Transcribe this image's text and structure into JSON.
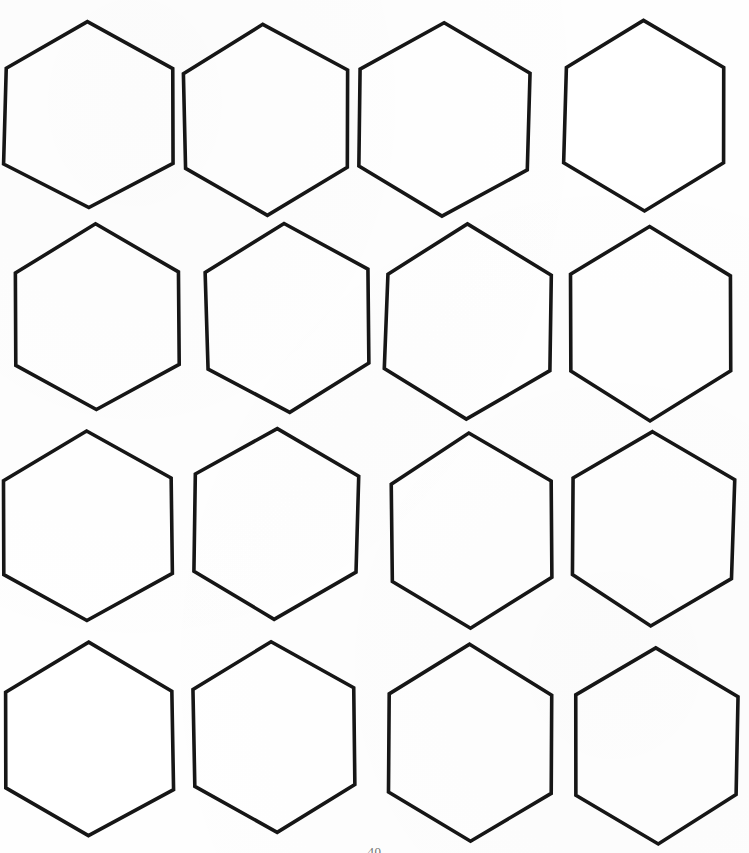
{
  "document": {
    "kind": "hexagon-template-worksheet",
    "title": "Hexagon Template Sheet",
    "page_number": "40",
    "background_color": "#fefefe",
    "stroke_color": "#161616",
    "stroke_width_px": 3.6,
    "canvas": {
      "width": 749,
      "height": 853
    }
  },
  "grid": {
    "rows": 4,
    "columns": 4,
    "total_shapes": 16,
    "shape_type": "hexagon",
    "orientation": "pointy-top",
    "fill": "none"
  },
  "shapes": [
    {
      "id": "hex-r1c1",
      "row": 1,
      "col": 1,
      "cx": 89,
      "cy": 116,
      "rx": 84,
      "ry": 93,
      "rot": 0.0
    },
    {
      "id": "hex-r1c2",
      "row": 1,
      "col": 2,
      "cx": 266,
      "cy": 120,
      "rx": 82,
      "ry": 96,
      "rot": -1.0
    },
    {
      "id": "hex-r1c3",
      "row": 1,
      "col": 3,
      "cx": 444,
      "cy": 120,
      "rx": 84,
      "ry": 96,
      "rot": 1.0
    },
    {
      "id": "hex-r1c4",
      "row": 1,
      "col": 4,
      "cx": 645,
      "cy": 115,
      "rx": 80,
      "ry": 95,
      "rot": 0.0
    },
    {
      "id": "hex-r2c1",
      "row": 2,
      "col": 1,
      "cx": 97,
      "cy": 318,
      "rx": 82,
      "ry": 93,
      "rot": 0.0
    },
    {
      "id": "hex-r2c2",
      "row": 2,
      "col": 2,
      "cx": 288,
      "cy": 318,
      "rx": 81,
      "ry": 95,
      "rot": -1.5
    },
    {
      "id": "hex-r2c3",
      "row": 2,
      "col": 3,
      "cx": 468,
      "cy": 322,
      "rx": 82,
      "ry": 97,
      "rot": 0.5
    },
    {
      "id": "hex-r2c4",
      "row": 2,
      "col": 4,
      "cx": 651,
      "cy": 323,
      "rx": 81,
      "ry": 97,
      "rot": 0.0
    },
    {
      "id": "hex-r3c1",
      "row": 3,
      "col": 1,
      "cx": 88,
      "cy": 527,
      "rx": 84,
      "ry": 95,
      "rot": 0.0
    },
    {
      "id": "hex-r3c2",
      "row": 3,
      "col": 2,
      "cx": 277,
      "cy": 524,
      "rx": 81,
      "ry": 96,
      "rot": 1.0
    },
    {
      "id": "hex-r3c3",
      "row": 3,
      "col": 3,
      "cx": 471,
      "cy": 531,
      "rx": 80,
      "ry": 97,
      "rot": -0.5
    },
    {
      "id": "hex-r3c4",
      "row": 3,
      "col": 4,
      "cx": 653,
      "cy": 528,
      "rx": 80,
      "ry": 97,
      "rot": 0.5
    },
    {
      "id": "hex-r4c1",
      "row": 4,
      "col": 1,
      "cx": 90,
      "cy": 740,
      "rx": 83,
      "ry": 97,
      "rot": 0.0
    },
    {
      "id": "hex-r4c2",
      "row": 4,
      "col": 2,
      "cx": 274,
      "cy": 737,
      "rx": 81,
      "ry": 96,
      "rot": -1.0
    },
    {
      "id": "hex-r4c3",
      "row": 4,
      "col": 3,
      "cx": 470,
      "cy": 743,
      "rx": 81,
      "ry": 98,
      "rot": 0.5
    },
    {
      "id": "hex-r4c4",
      "row": 4,
      "col": 4,
      "cx": 657,
      "cy": 745,
      "rx": 80,
      "ry": 98,
      "rot": 0.0
    }
  ]
}
